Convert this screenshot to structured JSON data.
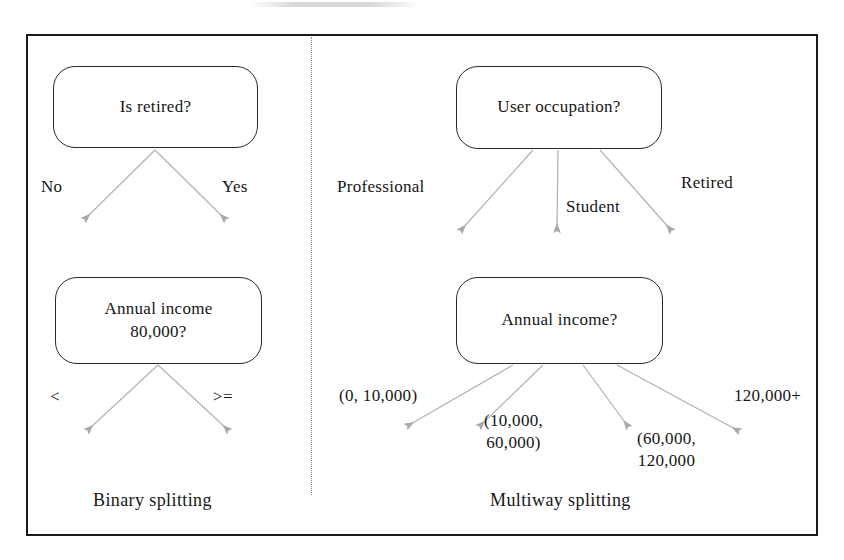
{
  "figure": {
    "type": "diagram",
    "panels": [
      {
        "id": "binary",
        "caption": "Binary splitting",
        "nodes": [
          {
            "id": "is-retired",
            "label": "Is retired?"
          },
          {
            "id": "annual-income-binary",
            "label": "Annual income\n80,000?"
          }
        ],
        "edges": [
          {
            "from": "is-retired",
            "label": "No"
          },
          {
            "from": "is-retired",
            "label": "Yes"
          },
          {
            "from": "annual-income-binary",
            "label": "<"
          },
          {
            "from": "annual-income-binary",
            "label": ">="
          }
        ]
      },
      {
        "id": "multiway",
        "caption": "Multiway splitting",
        "nodes": [
          {
            "id": "user-occupation",
            "label": "User occupation?"
          },
          {
            "id": "annual-income-multiway",
            "label": "Annual income?"
          }
        ],
        "edges": [
          {
            "from": "user-occupation",
            "label": "Professional"
          },
          {
            "from": "user-occupation",
            "label": "Student"
          },
          {
            "from": "user-occupation",
            "label": "Retired"
          },
          {
            "from": "annual-income-multiway",
            "label": "(0, 10,000)"
          },
          {
            "from": "annual-income-multiway",
            "label": "(10,000,\n60,000)"
          },
          {
            "from": "annual-income-multiway",
            "label": "(60,000,\n120,000"
          },
          {
            "from": "annual-income-multiway",
            "label": "120,000+"
          }
        ]
      }
    ]
  },
  "binary": {
    "node_is_retired": "Is retired?",
    "node_annual_income": "Annual income\n80,000?",
    "label_no": "No",
    "label_yes": "Yes",
    "label_lt": "<",
    "label_gte": ">=",
    "caption": "Binary splitting"
  },
  "multiway": {
    "node_user_occupation": "User occupation?",
    "node_annual_income": "Annual income?",
    "label_professional": "Professional",
    "label_student": "Student",
    "label_retired": "Retired",
    "label_range_1": "(0, 10,000)",
    "label_range_2": "(10,000,\n60,000)",
    "label_range_3": "(60,000,\n120,000",
    "label_range_4": "120,000+",
    "caption": "Multiway splitting"
  },
  "colors": {
    "frame": "#1a1a1a",
    "node_border": "#2a2a2a",
    "text": "#161616",
    "arrow": "#a9a9a9",
    "divider": "#8d8d8d",
    "background": "#ffffff"
  }
}
